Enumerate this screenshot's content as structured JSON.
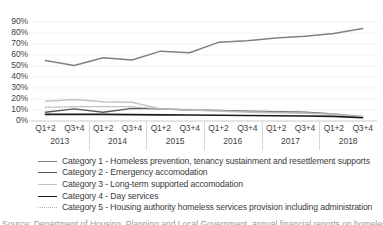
{
  "chart_data": {
    "type": "line",
    "title": "",
    "subtitle": "",
    "xlabel": "",
    "ylabel": "",
    "ylim": [
      0,
      90
    ],
    "y_ticks": [
      "0%",
      "10%",
      "20%",
      "30%",
      "40%",
      "50%",
      "60%",
      "70%",
      "80%",
      "90%"
    ],
    "y_tick_values": [
      0,
      10,
      20,
      30,
      40,
      50,
      60,
      70,
      80,
      90
    ],
    "grid": true,
    "grid_axis": "y",
    "legend_position": "bottom",
    "x": [
      "Q1+2",
      "Q3+4",
      "Q1+2",
      "Q3+4",
      "Q1+2",
      "Q3+4",
      "Q1+2",
      "Q3+4",
      "Q1+2",
      "Q3+4",
      "Q1+2",
      "Q3+4"
    ],
    "x_groups": [
      {
        "label": "2013",
        "span": 2
      },
      {
        "label": "2014",
        "span": 2
      },
      {
        "label": "2015",
        "span": 2
      },
      {
        "label": "2016",
        "span": 2
      },
      {
        "label": "2017",
        "span": 2
      },
      {
        "label": "2018",
        "span": 2
      }
    ],
    "series": [
      {
        "name": "Category 1 - Homeless prevention, tenancy sustainment and resettlement supports",
        "short_name": "Category 1",
        "color": "#808080",
        "style": "solid",
        "width": 1.5,
        "values": [
          55,
          50.5,
          57.5,
          55.5,
          63.5,
          62,
          71.5,
          73,
          75.5,
          77,
          79.5,
          84
        ]
      },
      {
        "name": "Category 2 - Emergency accomodation",
        "short_name": "Category 2",
        "color": "#595959",
        "style": "solid",
        "width": 1.4,
        "values": [
          8,
          11,
          8,
          11.5,
          11,
          10,
          9.5,
          9,
          8.5,
          8,
          6.5,
          3.5
        ]
      },
      {
        "name": "Category 3 - Long-term supported accomodation",
        "short_name": "Category 3",
        "color": "#c4c4c4",
        "style": "solid",
        "width": 1.4,
        "values": [
          18,
          19.5,
          17.5,
          17,
          11,
          10,
          9,
          8,
          7.5,
          7,
          6,
          4
        ]
      },
      {
        "name": "Category 4 - Day services",
        "short_name": "Category 4",
        "color": "#1a1a1a",
        "style": "solid",
        "width": 1.6,
        "values": [
          6,
          6,
          6,
          5.8,
          5.6,
          5.4,
          5.2,
          5,
          4.8,
          4.6,
          4.2,
          3
        ]
      },
      {
        "name": "Category 5 - Housing authority homeless services provision including administration",
        "short_name": "Category 5",
        "color": "#b5b5b5",
        "style": "dotted",
        "width": 1.3,
        "values": [
          12.5,
          13,
          13,
          13,
          11,
          10.5,
          9.5,
          8.5,
          8,
          7.5,
          6.5,
          4.5
        ]
      }
    ]
  },
  "caption": {
    "cut_text": "Source: Department of Housing, Planning and Local Government, annual financial reports on homeless services"
  }
}
